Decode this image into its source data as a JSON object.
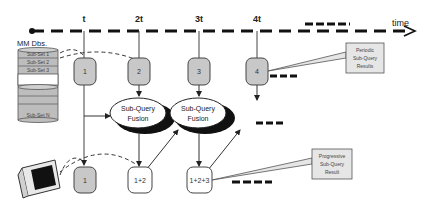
{
  "timeline": {
    "label": "time",
    "ticks": [
      "t",
      "2t",
      "3t",
      "4t"
    ]
  },
  "database": {
    "title": "MM Dbs.",
    "subsets": [
      "Sub-Set 1",
      "Sub-Set 2",
      "Sub-Set 3",
      "Sub-Set N"
    ]
  },
  "periodic_nodes": [
    "1",
    "2",
    "3",
    "4"
  ],
  "fusion_nodes": [
    {
      "line1": "Sub-Query",
      "line2": "Fusion"
    },
    {
      "line1": "Sub-Query",
      "line2": "Fusion"
    }
  ],
  "progressive_nodes": [
    "1",
    "1+2",
    "1+2+3"
  ],
  "callouts": {
    "periodic": {
      "line1": "Periodic",
      "line2": "Sub-Query",
      "line3": "Results"
    },
    "progressive": {
      "line1": "Progressive",
      "line2": "Sub-Query",
      "line3": "Result"
    }
  },
  "colors": {
    "periodic_fill": "#c8c8c8",
    "progressive_fill": "#ffffff",
    "stroke": "#333333",
    "callout_fill": "#e6e6e6"
  }
}
